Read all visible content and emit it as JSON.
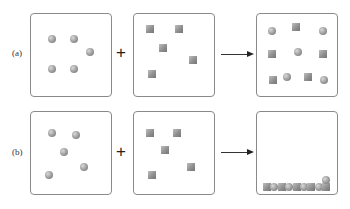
{
  "figure": {
    "rows": [
      {
        "label": "(a)",
        "operator": "+",
        "reactant_a": {
          "particle": "sphere",
          "count": 5,
          "positions": [
            [
              0.25,
              0.3
            ],
            [
              0.52,
              0.3
            ],
            [
              0.72,
              0.45
            ],
            [
              0.25,
              0.65
            ],
            [
              0.52,
              0.65
            ]
          ]
        },
        "reactant_b": {
          "particle": "cube",
          "count": 5,
          "positions": [
            [
              0.2,
              0.18
            ],
            [
              0.55,
              0.18
            ],
            [
              0.35,
              0.4
            ],
            [
              0.72,
              0.55
            ],
            [
              0.22,
              0.72
            ]
          ]
        },
        "product": {
          "description": "mixed, dispersed",
          "particles": [
            {
              "type": "sphere",
              "pos": [
                0.18,
                0.2
              ]
            },
            {
              "type": "cube",
              "pos": [
                0.48,
                0.15
              ]
            },
            {
              "type": "sphere",
              "pos": [
                0.8,
                0.2
              ]
            },
            {
              "type": "cube",
              "pos": [
                0.18,
                0.48
              ]
            },
            {
              "type": "sphere",
              "pos": [
                0.5,
                0.45
              ]
            },
            {
              "type": "cube",
              "pos": [
                0.8,
                0.48
              ]
            },
            {
              "type": "cube",
              "pos": [
                0.2,
                0.78
              ]
            },
            {
              "type": "sphere",
              "pos": [
                0.36,
                0.75
              ]
            },
            {
              "type": "cube",
              "pos": [
                0.62,
                0.75
              ]
            },
            {
              "type": "sphere",
              "pos": [
                0.82,
                0.78
              ]
            }
          ]
        }
      },
      {
        "label": "(b)",
        "operator": "+",
        "reactant_a": {
          "particle": "sphere",
          "count": 5,
          "positions": [
            [
              0.25,
              0.25
            ],
            [
              0.55,
              0.27
            ],
            [
              0.4,
              0.48
            ],
            [
              0.65,
              0.65
            ],
            [
              0.22,
              0.75
            ]
          ]
        },
        "reactant_b": {
          "particle": "cube",
          "count": 5,
          "positions": [
            [
              0.2,
              0.25
            ],
            [
              0.52,
              0.25
            ],
            [
              0.38,
              0.45
            ],
            [
              0.7,
              0.65
            ],
            [
              0.22,
              0.75
            ]
          ]
        },
        "product": {
          "description": "precipitate settled at bottom",
          "precipitate": [
            "cube",
            "sphere",
            "cube",
            "sphere",
            "cube",
            "sphere",
            "cube",
            "sphere",
            "cube"
          ],
          "extra_sphere_top": true
        }
      }
    ],
    "arrow": "→"
  }
}
